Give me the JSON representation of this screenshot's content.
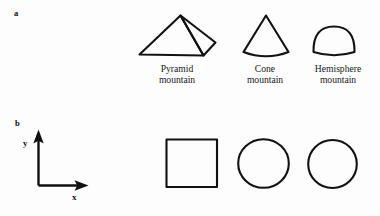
{
  "figure": {
    "background_color": "#fdfdfd",
    "stroke_color": "#111111",
    "panels": [
      {
        "letter": "a",
        "description": "Three-dimensional mountain shape silhouettes"
      },
      {
        "letter": "b",
        "description": "Corresponding two-dimensional base footprints with coordinate axes"
      }
    ]
  },
  "panel_a": {
    "letter": "a",
    "shapes": [
      {
        "icon": "pyramid-mountain-icon",
        "caption_line1": "Pyramid",
        "caption_line2": "mountain"
      },
      {
        "icon": "cone-mountain-icon",
        "caption_line1": "Cone",
        "caption_line2": "mountain"
      },
      {
        "icon": "hemisphere-mountain-icon",
        "caption_line1": "Hemisphere",
        "caption_line2": "mountain"
      }
    ]
  },
  "panel_b": {
    "letter": "b",
    "axes": {
      "x_label": "x",
      "y_label": "y",
      "origin_x": 38,
      "origin_y": 185,
      "x_tip": 88,
      "y_tip": 130
    },
    "footprints": [
      {
        "icon": "square-footprint-icon",
        "shape": "square"
      },
      {
        "icon": "circle-footprint-icon",
        "shape": "circle"
      },
      {
        "icon": "circle-footprint-icon",
        "shape": "circle"
      }
    ]
  }
}
